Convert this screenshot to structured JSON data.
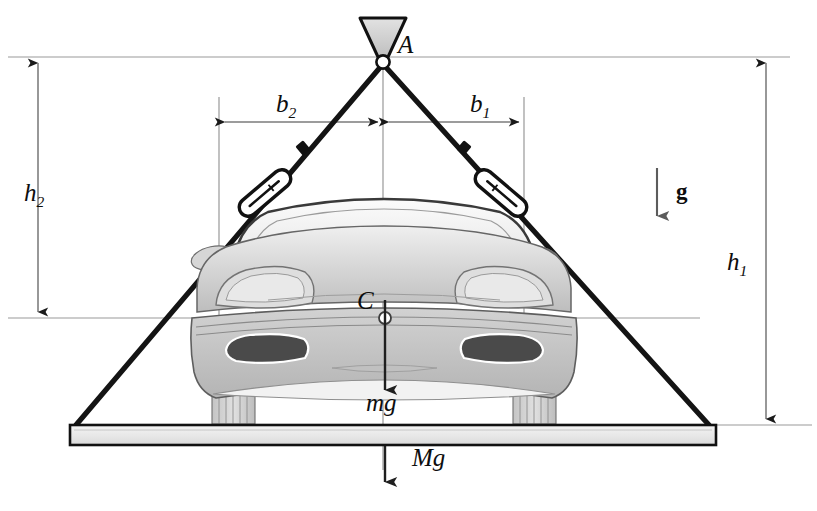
{
  "figure": {
    "type": "free-body-diagram"
  },
  "labels": {
    "apex_point": "A",
    "center_of_mass": "C",
    "b2": "b",
    "b2_sub": "2",
    "b1": "b",
    "b1_sub": "1",
    "h2": "h",
    "h2_sub": "2",
    "h1": "h",
    "h1_sub": "1",
    "weight_car": "mg",
    "weight_platform": "Mg",
    "gravity_vector": "g"
  },
  "geometry": {
    "apex": {
      "x": 383,
      "y": 62
    },
    "center_of_mass": {
      "x": 385,
      "y": 318
    },
    "left_anchor": {
      "x": 76,
      "y": 425
    },
    "right_anchor": {
      "x": 709,
      "y": 425
    },
    "b2_extension_x": 219,
    "b1_extension_x": 524,
    "dim_line_b_y": 122,
    "top_reference_y": 57,
    "com_reference_y": 318,
    "platform_top_y": 425,
    "platform_bottom_y": 445,
    "platform_left_x": 70,
    "platform_right_x": 716,
    "h2_dim_x": 38,
    "h1_dim_x": 766,
    "gravity_arrow_x": 657
  },
  "colors": {
    "cable": "#141414",
    "outline": "#111111",
    "dimension_line": "#8a8a8a",
    "reference_line": "#9a9a9a",
    "car_body_light": "#e8e8e8",
    "car_body_mid": "#c9c9c9",
    "car_body_dark": "#a8a8a8",
    "intake_dark": "#4a4a4a",
    "platform_fill": "#ececec",
    "hook_fill": "#d5d5d5",
    "background": "#ffffff"
  },
  "elements": {
    "hook": "triangular-hook-at-apex",
    "turnbuckle_left": "cable-tensioner-left",
    "turnbuckle_right": "cable-tensioner-right",
    "knot_left": "cable-knot-left",
    "knot_right": "cable-knot-right",
    "platform": "ground-platform-bar",
    "vehicle": "sports-car-front-view"
  }
}
